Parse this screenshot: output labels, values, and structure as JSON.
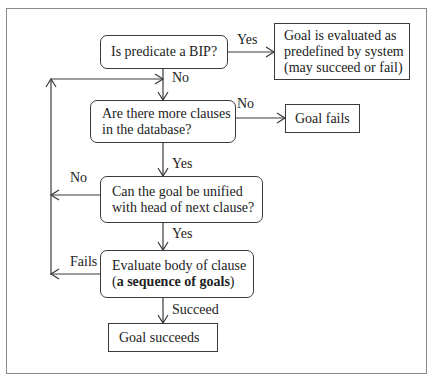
{
  "diagram": {
    "title": "",
    "nodes": {
      "is_bip": {
        "text": "Is predicate a BIP?"
      },
      "evaluated_predefined": {
        "lines": [
          "Goal is evaluated as",
          "predefined by system",
          "(may succeed or fail)"
        ]
      },
      "more_clauses": {
        "lines": [
          "Are there more clauses",
          "in the database?"
        ]
      },
      "goal_fails": {
        "text": "Goal fails"
      },
      "unify": {
        "lines": [
          "Can the goal be unified",
          "with head of next clause?"
        ]
      },
      "evaluate_body": {
        "line1": "Evaluate body of clause",
        "line2_open": "(",
        "line2_bold": "a sequence of goals",
        "line2_close": ")"
      },
      "goal_succeeds": {
        "text": "Goal succeeds"
      }
    },
    "edge_labels": {
      "bip_yes": "Yes",
      "bip_no": "No",
      "more_no": "No",
      "more_yes": "Yes",
      "unify_no": "No",
      "unify_yes": "Yes",
      "body_fails": "Fails",
      "body_succeed": "Succeed"
    },
    "edges": [
      {
        "from": "is_bip",
        "to": "evaluated_predefined",
        "label": "Yes"
      },
      {
        "from": "is_bip",
        "to": "more_clauses",
        "label": "No"
      },
      {
        "from": "more_clauses",
        "to": "goal_fails",
        "label": "No"
      },
      {
        "from": "more_clauses",
        "to": "unify",
        "label": "Yes"
      },
      {
        "from": "unify",
        "to": "loop_back_to_more_clauses",
        "label": "No"
      },
      {
        "from": "unify",
        "to": "evaluate_body",
        "label": "Yes"
      },
      {
        "from": "evaluate_body",
        "to": "loop_back_to_more_clauses",
        "label": "Fails"
      },
      {
        "from": "evaluate_body",
        "to": "goal_succeeds",
        "label": "Succeed"
      }
    ],
    "colors": {
      "stroke": "#3a3a3a",
      "frame": "#8a8a8a",
      "background": "#ffffff"
    }
  }
}
